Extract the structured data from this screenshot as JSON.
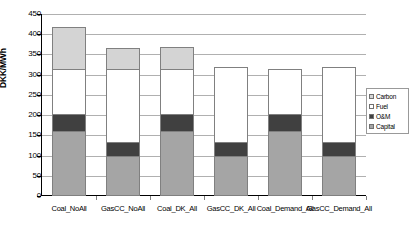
{
  "chart_data": {
    "type": "bar",
    "subtype": "stacked-column",
    "title": "",
    "xlabel": "",
    "ylabel": "DKK/MWh",
    "ylim": [
      0,
      450
    ],
    "ytick_step": 50,
    "yticks": [
      0,
      50,
      100,
      150,
      200,
      250,
      300,
      350,
      400,
      450
    ],
    "ytick_labels": [
      "0",
      "50",
      "100",
      "150",
      "200",
      "250",
      "300",
      "350",
      "400",
      "450"
    ],
    "grid": "horizontal",
    "legend_position": "right",
    "categories": [
      "Coal_NoAll",
      "GasCC_NoAll",
      "Coal_DK_All",
      "GasCC_DK_All",
      "Coal_Demand_All",
      "GasCC_Demand_All"
    ],
    "series": [
      {
        "name": "Capital",
        "color": "#a5a5a5",
        "values": [
          160,
          100,
          160,
          100,
          160,
          100
        ]
      },
      {
        "name": "O&M",
        "color": "#404040",
        "values": [
          43,
          33,
          43,
          33,
          43,
          33
        ]
      },
      {
        "name": "Fuel",
        "color": "#ffffff",
        "values": [
          110,
          182,
          110,
          185,
          110,
          185
        ]
      },
      {
        "name": "Carbon",
        "color": "#d4d4d4",
        "values": [
          105,
          50,
          55,
          0,
          0,
          0
        ]
      }
    ],
    "totals": [
      418,
      365,
      368,
      318,
      313,
      318
    ],
    "stack_order_bottom_to_top": [
      "Capital",
      "O&M",
      "Fuel",
      "Carbon"
    ],
    "legend_order_top_to_bottom": [
      "Carbon",
      "Fuel",
      "O&M",
      "Capital"
    ]
  },
  "legend": {
    "items": [
      {
        "label": "Carbon",
        "color": "#d4d4d4"
      },
      {
        "label": "Fuel",
        "color": "#ffffff"
      },
      {
        "label": "O&M",
        "color": "#404040"
      },
      {
        "label": "Capital",
        "color": "#a5a5a5"
      }
    ]
  }
}
